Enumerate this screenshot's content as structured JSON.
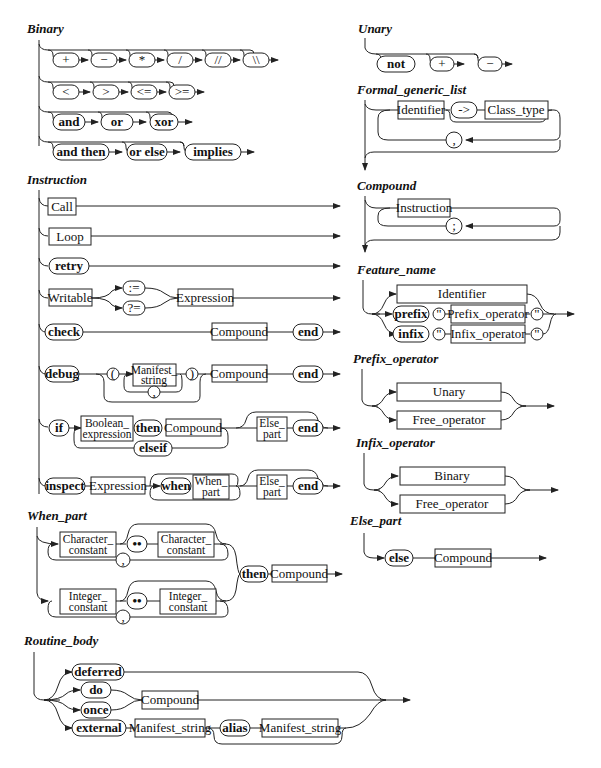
{
  "page_header": "",
  "diagrams": {
    "binary": {
      "title": "Binary",
      "row1": [
        "+",
        "−",
        "*",
        "/",
        "//",
        "\\\\"
      ],
      "row2": [
        "<",
        ">",
        "<=",
        ">="
      ],
      "row3": [
        "and",
        "or",
        "xor"
      ],
      "row4": [
        "and then",
        "or else",
        "implies"
      ]
    },
    "unary": {
      "title": "Unary",
      "items": [
        "not",
        "+",
        "−"
      ]
    },
    "formal_generic_list": {
      "title": "Formal_generic_list",
      "identifier": "Identifier",
      "arrow": "->",
      "class_type": "Class_type",
      "separator": ","
    },
    "compound": {
      "title": "Compound",
      "instruction": "Instruction",
      "separator": ";"
    },
    "feature_name": {
      "title": "Feature_name",
      "identifier": "Identifier",
      "prefix": "prefix",
      "infix": "infix",
      "quote": "\"",
      "prefix_operator": "Prefix_operator",
      "infix_operator": "Infix_operator"
    },
    "prefix_operator": {
      "title": "Prefix_operator",
      "items": [
        "Unary",
        "Free_operator"
      ]
    },
    "infix_operator": {
      "title": "Infix_operator",
      "items": [
        "Binary",
        "Free_operator"
      ]
    },
    "else_part": {
      "title": "Else_part",
      "keyword": "else",
      "compound": "Compound"
    },
    "instruction": {
      "title": "Instruction",
      "call": "Call",
      "loop": "Loop",
      "retry": "retry",
      "writable": "Writable",
      "assign": ":=",
      "assign_attempt": "?=",
      "expression": "Expression",
      "check": "check",
      "compound": "Compound",
      "end": "end",
      "debug": "debug",
      "lparen": "(",
      "rparen": ")",
      "manifest_string_1": "Manifest_",
      "manifest_string_2": "string",
      "comma": ",",
      "if": "if",
      "boolean_expression_1": "Boolean_",
      "boolean_expression_2": "expression",
      "then": "then",
      "elseif": "elseif",
      "else_part_1": "Else_",
      "else_part_2": "part",
      "inspect": "inspect",
      "when": "when",
      "when_part_1": "When_",
      "when_part_2": "part"
    },
    "when_part": {
      "title": "When_part",
      "character_constant_1": "Character_",
      "character_constant_2": "constant",
      "integer_constant_1": "Integer_",
      "integer_constant_2": "constant",
      "range": "••",
      "comma": ",",
      "then": "then",
      "compound": "Compound"
    },
    "routine_body": {
      "title": "Routine_body",
      "deferred": "deferred",
      "do": "do",
      "once": "once",
      "compound": "Compound",
      "external": "external",
      "manifest_string": "Manifest_string",
      "alias": "alias"
    }
  }
}
